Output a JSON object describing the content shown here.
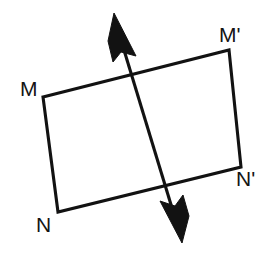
{
  "figure": {
    "background_color": "#ffffff",
    "ink_color": "#121212",
    "canvas": {
      "width": 276,
      "height": 270
    },
    "labels": [
      {
        "id": "M",
        "text": "M",
        "x": 20,
        "y": 96,
        "vertex_x": 43,
        "vertex_y": 97
      },
      {
        "id": "Mp",
        "text": "M'",
        "x": 219,
        "y": 42,
        "vertex_x": 229,
        "vertex_y": 50
      },
      {
        "id": "N",
        "text": "N",
        "x": 36,
        "y": 232,
        "vertex_x": 58,
        "vertex_y": 212
      },
      {
        "id": "Np",
        "text": "N'",
        "x": 236,
        "y": 186,
        "vertex_x": 241,
        "vertex_y": 167
      }
    ],
    "quadrilateral": {
      "name": "rectangle-MNN'M'",
      "points": "43,97 229,50 241,167 58,212",
      "vertices": [
        {
          "label": "M",
          "x": 43,
          "y": 97
        },
        {
          "label": "M'",
          "x": 229,
          "y": 50
        },
        {
          "label": "N'",
          "x": 241,
          "y": 167
        },
        {
          "label": "N",
          "x": 58,
          "y": 212
        }
      ]
    },
    "axis": {
      "name": "line-of-reflection",
      "x1": 117,
      "y1": 27,
      "x2": 179,
      "y2": 231,
      "arrow_top": "114,13 136,56 121,52 113,62 108,41",
      "arrow_bottom": "182,243 160,201 175,206 183,195 189,216"
    }
  }
}
